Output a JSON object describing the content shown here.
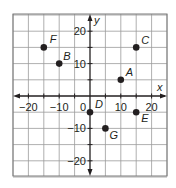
{
  "graph": {
    "x_axis_label": "x",
    "y_axis_label": "y",
    "x_range": [
      -25,
      25
    ],
    "y_range": [
      -25,
      25
    ],
    "grid_step": 5,
    "x_tick_labels": [
      {
        "value": -20,
        "text": "−20"
      },
      {
        "value": -10,
        "text": "−10"
      },
      {
        "value": 10,
        "text": "10"
      },
      {
        "value": 20,
        "text": "20"
      }
    ],
    "y_tick_labels": [
      {
        "value": 20,
        "text": "20"
      },
      {
        "value": 10,
        "text": "10"
      },
      {
        "value": -10,
        "text": "−10"
      },
      {
        "value": -20,
        "text": "−20"
      }
    ],
    "origin_label": "0",
    "points": [
      {
        "label": "A",
        "x": 10,
        "y": 5
      },
      {
        "label": "B",
        "x": -10,
        "y": 10
      },
      {
        "label": "C",
        "x": 15,
        "y": 15
      },
      {
        "label": "D",
        "x": 0,
        "y": -5
      },
      {
        "label": "E",
        "x": 15,
        "y": -5
      },
      {
        "label": "F",
        "x": -15,
        "y": 15
      },
      {
        "label": "G",
        "x": 5,
        "y": -10
      }
    ],
    "colors": {
      "grid": "#9a9a9a",
      "frame": "#7a7a7a",
      "axis": "#231f20",
      "point": "#231f20",
      "text": "#231f20"
    }
  }
}
